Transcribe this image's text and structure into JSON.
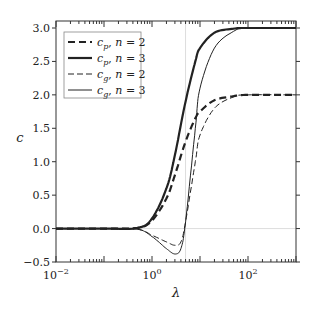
{
  "chart_data": {
    "type": "line",
    "title": "",
    "xlabel": "λ",
    "ylabel": "c",
    "xscale": "log",
    "xlim": [
      0.01,
      1000
    ],
    "ylim": [
      -0.5,
      3.0
    ],
    "xticks": [
      "10^-2",
      "10^0",
      "10^2"
    ],
    "yticks": [
      "−0.5",
      "0.0",
      "0.5",
      "1.0",
      "1.5",
      "2.0",
      "2.5",
      "3.0"
    ],
    "grid": "faint lines at y=0 and x=5",
    "legend_position": "upper left",
    "series": [
      {
        "name": "c_p, n = 2",
        "style": "thick dashed",
        "x": [
          0.01,
          0.1,
          0.5,
          1,
          2,
          3,
          5,
          8,
          10,
          20,
          50,
          100,
          1000
        ],
        "y": [
          0,
          0,
          0.01,
          0.12,
          0.45,
          0.8,
          1.3,
          1.65,
          1.75,
          1.92,
          1.98,
          2.0,
          2.0
        ]
      },
      {
        "name": "c_p, n = 3",
        "style": "thick solid",
        "x": [
          0.01,
          0.1,
          0.5,
          1,
          2,
          3,
          5,
          8,
          10,
          20,
          50,
          100,
          1000
        ],
        "y": [
          0,
          0,
          0.01,
          0.15,
          0.6,
          1.1,
          1.9,
          2.5,
          2.7,
          2.93,
          2.99,
          3.0,
          3.0
        ]
      },
      {
        "name": "c_g, n = 2",
        "style": "thin dashed",
        "x": [
          0.01,
          0.1,
          0.5,
          1,
          2,
          3,
          4,
          5,
          8,
          10,
          20,
          50,
          100,
          1000
        ],
        "y": [
          0,
          0,
          -0.01,
          -0.1,
          -0.2,
          -0.25,
          -0.2,
          0.1,
          1.0,
          1.4,
          1.8,
          1.97,
          2.0,
          2.0
        ]
      },
      {
        "name": "c_g, n = 3",
        "style": "thin solid",
        "x": [
          0.01,
          0.1,
          0.5,
          1,
          2,
          3,
          4,
          5,
          8,
          10,
          20,
          50,
          100,
          1000
        ],
        "y": [
          0,
          0,
          -0.01,
          -0.12,
          -0.3,
          -0.38,
          -0.3,
          0.1,
          1.5,
          2.1,
          2.7,
          2.95,
          3.0,
          3.0
        ]
      }
    ]
  }
}
